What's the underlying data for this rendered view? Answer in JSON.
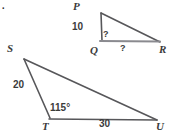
{
  "figure": {
    "stroke_color": "#57575a",
    "accent_color": "#8a8a8f",
    "text_color": "#3b3b3b",
    "background": "#ffffff",
    "corner_artifact": "."
  },
  "triangles": [
    {
      "id": "PQR",
      "name": "upper-triangle-pqr",
      "vertices": [
        {
          "label": "P",
          "x": 101,
          "y": 13
        },
        {
          "label": "Q",
          "x": 102,
          "y": 41
        },
        {
          "label": "R",
          "x": 160,
          "y": 42
        }
      ],
      "vertex_label_positions": [
        {
          "label": "P",
          "x": 73,
          "y": 1
        },
        {
          "label": "Q",
          "x": 90,
          "y": 45
        },
        {
          "label": "R",
          "x": 159,
          "y": 44
        }
      ],
      "sides": [
        {
          "from": "P",
          "to": "Q",
          "label": "10",
          "label_x": 72,
          "label_y": 22
        },
        {
          "from": "Q",
          "to": "R",
          "label": "?",
          "label_x": 120,
          "label_y": 44
        },
        {
          "from": "P",
          "to": "R",
          "label": "",
          "label_x": 0,
          "label_y": 0
        }
      ],
      "angles": [
        {
          "at": "Q",
          "label": "?",
          "label_x": 103,
          "label_y": 30
        }
      ]
    },
    {
      "id": "STU",
      "name": "lower-triangle-stu",
      "vertices": [
        {
          "label": "S",
          "x": 24,
          "y": 59
        },
        {
          "label": "T",
          "x": 50,
          "y": 118
        },
        {
          "label": "U",
          "x": 157,
          "y": 120
        }
      ],
      "vertex_label_positions": [
        {
          "label": "S",
          "x": 7,
          "y": 43
        },
        {
          "label": "T",
          "x": 42,
          "y": 121
        },
        {
          "label": "U",
          "x": 156,
          "y": 121
        }
      ],
      "sides": [
        {
          "from": "S",
          "to": "T",
          "label": "20",
          "label_x": 13,
          "label_y": 80
        },
        {
          "from": "T",
          "to": "U",
          "label": "30",
          "label_x": 99,
          "label_y": 119
        },
        {
          "from": "S",
          "to": "U",
          "label": "",
          "label_x": 0,
          "label_y": 0
        }
      ],
      "angles": [
        {
          "at": "T",
          "label": "115°",
          "label_x": 50,
          "label_y": 103
        }
      ]
    }
  ]
}
